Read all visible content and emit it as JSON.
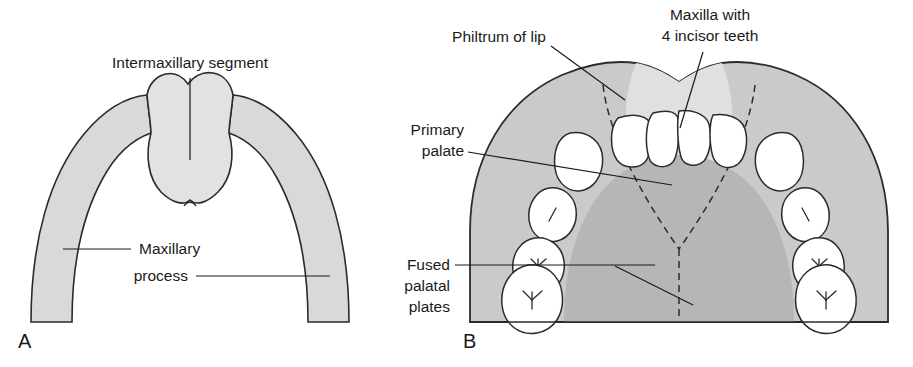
{
  "figure": {
    "panels": [
      {
        "letter": "A",
        "labels": [
          {
            "id": "intermaxillary-segment",
            "text": "Intermaxillary segment"
          },
          {
            "id": "maxillary-process",
            "line1": "Maxillary",
            "line2": "process"
          }
        ]
      },
      {
        "letter": "B",
        "labels": [
          {
            "id": "philtrum-of-lip",
            "text": "Philtrum of lip"
          },
          {
            "id": "maxilla-incisors",
            "line1": "Maxilla with",
            "line2": "4 incisor teeth"
          },
          {
            "id": "primary-palate",
            "line1": "Primary",
            "line2": "palate"
          },
          {
            "id": "fused-palatal-plates",
            "line1": "Fused",
            "line2": "palatal",
            "line3": "plates"
          }
        ]
      }
    ]
  },
  "colors": {
    "background": "#ffffff",
    "ink": "#1a1a1a",
    "outline": "#2b2b2b",
    "band_light": "#d9d9d9",
    "segment_light": "#e2e2e2",
    "arch_mid": "#cacaca",
    "philtrum_light": "#e0e0e0",
    "palate_dark": "#b6b6b6",
    "tooth_fill": "#ffffff"
  },
  "diagram_data": {
    "type": "anatomical-illustration",
    "subject": "Palatal development, inferior (occlusal) view of the maxilla",
    "panel_a": {
      "description": "Early stage: horseshoe-shaped maxillary processes flanking a central intermaxillary segment",
      "regions": [
        {
          "name": "maxillary process",
          "side": "left",
          "shade": "#d9d9d9"
        },
        {
          "name": "maxillary process",
          "side": "right",
          "shade": "#d9d9d9"
        },
        {
          "name": "intermaxillary segment",
          "side": "midline",
          "shade": "#e2e2e2"
        }
      ]
    },
    "panel_b": {
      "description": "Later stage: fused palate with primary palate, philtrum of lip and 10 teeth per arch",
      "regions": [
        {
          "name": "philtrum of lip",
          "shade": "#e0e0e0"
        },
        {
          "name": "primary palate",
          "shade": "#cacaca"
        },
        {
          "name": "fused palatal plates",
          "shade": "#b6b6b6"
        }
      ],
      "teeth": {
        "incisor_count": 4,
        "total_count": 14,
        "groups": [
          {
            "name": "central and lateral incisors",
            "count": 4,
            "marking": "none"
          },
          {
            "name": "canines",
            "count": 2,
            "marking": "none"
          },
          {
            "name": "first deciduous molars",
            "count": 2,
            "marking": "slash"
          },
          {
            "name": "second deciduous molars",
            "count": 2,
            "marking": "y-fissure"
          },
          {
            "name": "third deciduous molars",
            "count": 2,
            "marking": "y-fissure"
          }
        ]
      },
      "midline_suture": {
        "style": "dashed",
        "name": "palatal midline suture"
      }
    }
  }
}
